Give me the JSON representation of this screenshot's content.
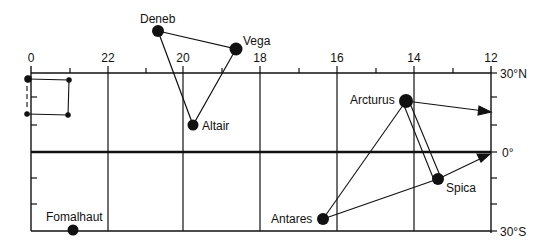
{
  "diagram": {
    "type": "star-map",
    "ra_labels": [
      {
        "text": "0",
        "x": 31
      },
      {
        "text": "22",
        "x": 108
      },
      {
        "text": "20",
        "x": 183
      },
      {
        "text": "18",
        "x": 260
      },
      {
        "text": "16",
        "x": 337
      },
      {
        "text": "14",
        "x": 414
      },
      {
        "text": "12",
        "x": 491
      }
    ],
    "dec_labels": {
      "north": "30°N",
      "equator": "0°",
      "south": "30°S"
    },
    "stars": [
      {
        "name": "Deneb",
        "x": 158,
        "y": 31,
        "r": 6
      },
      {
        "name": "Vega",
        "x": 236,
        "y": 49,
        "r": 6.5
      },
      {
        "name": "Altair",
        "x": 193,
        "y": 125,
        "r": 5.5
      },
      {
        "name": "Arcturus",
        "x": 406,
        "y": 101,
        "r": 7
      },
      {
        "name": "Spica",
        "x": 438,
        "y": 179,
        "r": 6
      },
      {
        "name": "Antares",
        "x": 323,
        "y": 219,
        "r": 6
      },
      {
        "name": "Fomalhaut",
        "x": 73,
        "y": 230,
        "r": 5.5
      }
    ],
    "asterisms": [
      {
        "name": "Summer Triangle",
        "stars": [
          "Deneb",
          "Vega",
          "Altair"
        ]
      },
      {
        "name": "Spring Triangle",
        "stars": [
          "Arcturus",
          "Spica",
          "Antares"
        ]
      }
    ],
    "square_corners": [
      [
        28,
        79
      ],
      [
        69,
        80
      ],
      [
        68,
        115
      ],
      [
        27,
        114
      ]
    ]
  }
}
